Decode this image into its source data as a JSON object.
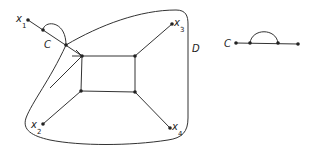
{
  "diagram": {
    "colors": {
      "line": "#333333",
      "background": "#ffffff"
    },
    "left_figure": {
      "region_label": "D",
      "curve_label": "C",
      "terminals": [
        {
          "name": "x",
          "sub": "1"
        },
        {
          "name": "x",
          "sub": "2"
        },
        {
          "name": "x",
          "sub": "3"
        },
        {
          "name": "x",
          "sub": "4"
        }
      ]
    },
    "right_figure": {
      "curve_label": "C"
    }
  }
}
